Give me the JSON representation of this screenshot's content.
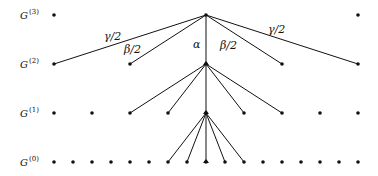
{
  "diagram": {
    "type": "hierarchical-tree",
    "levels": [
      {
        "name": "G",
        "superscript": "(3)",
        "y": 15,
        "nodes_x": [
          54,
          206,
          358
        ]
      },
      {
        "name": "G",
        "superscript": "(2)",
        "y": 64,
        "nodes_x": [
          54,
          130,
          206,
          282,
          358
        ]
      },
      {
        "name": "G",
        "superscript": "(1)",
        "y": 113,
        "nodes_x": [
          54,
          92,
          130,
          168,
          206,
          244,
          282,
          320,
          358
        ]
      },
      {
        "name": "G",
        "superscript": "(0)",
        "y": 162,
        "nodes_x": [
          54,
          73,
          92,
          111,
          130,
          149,
          168,
          187,
          206,
          225,
          244,
          263,
          282,
          301,
          320,
          339,
          358
        ]
      }
    ],
    "edge_labels": {
      "gamma_left": "γ/2",
      "beta_left": "β/2",
      "alpha": "α",
      "beta_right": "β/2",
      "gamma_right": "γ/2"
    }
  }
}
